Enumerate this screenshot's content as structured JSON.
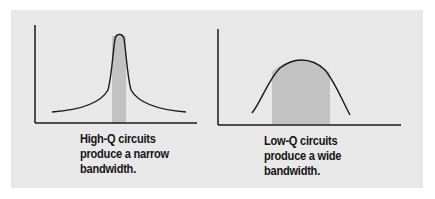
{
  "colors": {
    "panel_bg": "#e8e8e8",
    "curve": "#1a1a1a",
    "bandwidth_fill": "#c2c2c2",
    "text": "#151515"
  },
  "diagrams": [
    {
      "id": "high-q",
      "curve_shape": "narrow-sharp-peak",
      "caption_lines": [
        "High-Q circuits",
        "produce a narrow",
        "bandwidth."
      ]
    },
    {
      "id": "low-q",
      "curve_shape": "wide-rounded-peak",
      "caption_lines": [
        "Low-Q circuits",
        "produce a wide",
        "bandwidth."
      ]
    }
  ]
}
